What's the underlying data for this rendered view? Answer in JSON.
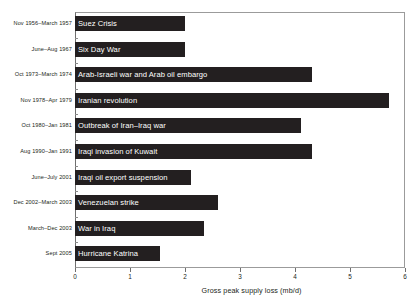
{
  "chart_data": {
    "type": "bar",
    "orientation": "horizontal",
    "title": "",
    "xlabel": "Gross peak supply loss (mb/d)",
    "ylabel": "",
    "xlim": [
      0,
      6
    ],
    "xticks": [
      "0",
      "1",
      "2",
      "3",
      "4",
      "5",
      "6"
    ],
    "grid": false,
    "legend": "none",
    "bar_color": "#231f20",
    "categories": [
      "Nov 1956–March 1957",
      "June–Aug 1967",
      "Oct 1973–March 1974",
      "Nov 1978–Apr 1979",
      "Oct 1980–Jan 1981",
      "Aug 1990–Jan 1991",
      "June–July 2001",
      "Dec 2002–March 2003",
      "March–Dec 2003",
      "Sept 2005"
    ],
    "bar_labels": [
      "Suez Crisis",
      "Six Day War",
      "Arab-Israeli war and Arab oil embargo",
      "Iranian revolution",
      "Outbreak of Iran–Iraq war",
      "Iraqi invasion of Kuwait",
      "Iraqi oil export suspension",
      "Venezuelan strike",
      "War in Iraq",
      "Hurricane Katrina"
    ],
    "values": [
      2.0,
      2.0,
      4.3,
      5.7,
      4.1,
      4.3,
      2.1,
      2.6,
      2.35,
      1.55
    ]
  }
}
